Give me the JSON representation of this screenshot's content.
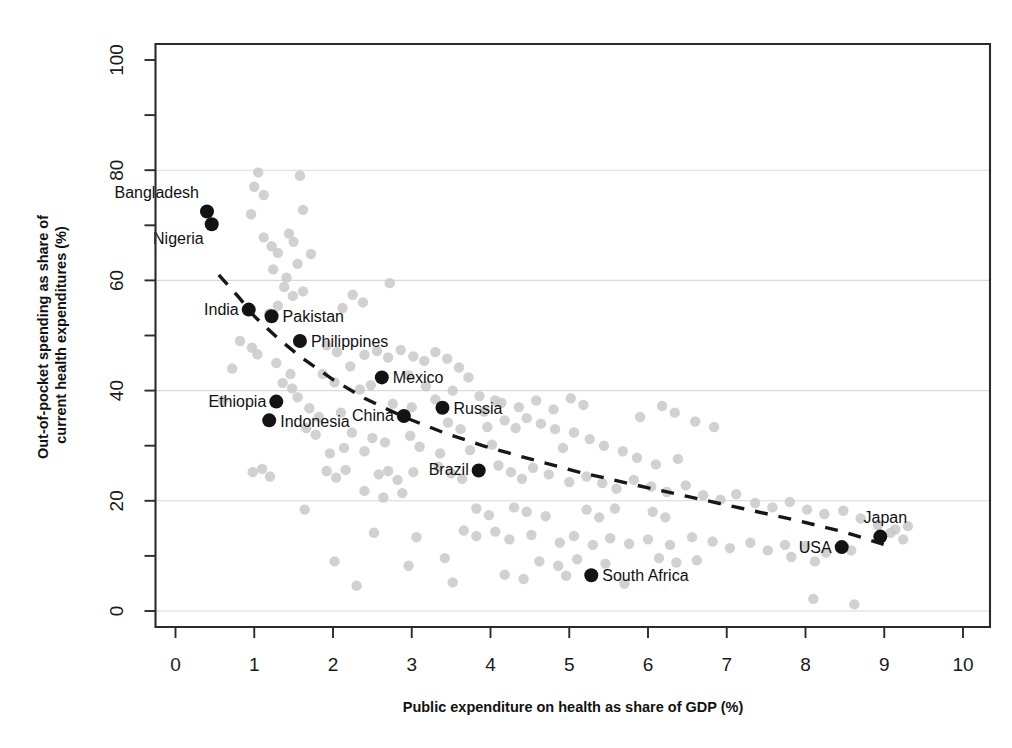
{
  "chart_data": {
    "type": "scatter",
    "title": "",
    "xlabel": "Public expenditure on health as share of GDP (%)",
    "ylabel": "Out-of-pocket spending as share of current health expenditures (%)",
    "xlim": [
      0,
      10
    ],
    "ylim": [
      0,
      100
    ],
    "xticks": [
      0,
      1,
      2,
      3,
      4,
      5,
      6,
      7,
      8,
      9,
      10
    ],
    "xtick_labels": [
      "0",
      "1",
      "2",
      "3",
      "4",
      "5",
      "6",
      "7",
      "8",
      "9",
      "10"
    ],
    "yticks": [
      0,
      20,
      40,
      60,
      80,
      100
    ],
    "ytick_labels": [
      "0",
      "20",
      "40",
      "60",
      "80",
      "100"
    ],
    "yminor_ticks": [
      10,
      30,
      50,
      70,
      90
    ],
    "grid": "horizontal",
    "gridlines_y": [
      0,
      20,
      40,
      60,
      80
    ],
    "legend": "none",
    "point_color": "#c9c9c9",
    "highlight_color": "#131313",
    "trend_color": "#171717",
    "trend_style": "dashed",
    "trend_note": "Downward-sloping dashed fitted curve from about (0.55, 61) to (9.1, 11)",
    "trend_points": [
      [
        0.55,
        61.0
      ],
      [
        0.8,
        57.0
      ],
      [
        1.0,
        53.5
      ],
      [
        1.3,
        49.5
      ],
      [
        1.6,
        46.0
      ],
      [
        2.0,
        42.0
      ],
      [
        2.4,
        38.6
      ],
      [
        2.9,
        35.2
      ],
      [
        3.4,
        32.4
      ],
      [
        3.9,
        30.0
      ],
      [
        4.5,
        27.6
      ],
      [
        5.1,
        25.3
      ],
      [
        5.8,
        23.0
      ],
      [
        6.5,
        20.8
      ],
      [
        7.2,
        18.6
      ],
      [
        7.9,
        16.4
      ],
      [
        8.5,
        14.3
      ],
      [
        9.1,
        11.6
      ]
    ],
    "highlighted": [
      {
        "name": "Bangladesh",
        "x": 0.4,
        "y": 72.5,
        "label_dx": -8,
        "label_dy": -14,
        "anchor": "end"
      },
      {
        "name": "Nigeria",
        "x": 0.46,
        "y": 70.2,
        "label_dx": -8,
        "label_dy": 20,
        "anchor": "end"
      },
      {
        "name": "India",
        "x": 0.93,
        "y": 54.7,
        "label_dx": -10,
        "label_dy": 5,
        "anchor": "end"
      },
      {
        "name": "Pakistan",
        "x": 1.22,
        "y": 53.5,
        "label_dx": 11,
        "label_dy": 6,
        "anchor": "start"
      },
      {
        "name": "Philippines",
        "x": 1.58,
        "y": 49.0,
        "label_dx": 11,
        "label_dy": 6,
        "anchor": "start"
      },
      {
        "name": "Mexico",
        "x": 2.62,
        "y": 42.4,
        "label_dx": 11,
        "label_dy": 6,
        "anchor": "start"
      },
      {
        "name": "Ethiopia",
        "x": 1.28,
        "y": 38.0,
        "label_dx": -10,
        "label_dy": 5,
        "anchor": "end"
      },
      {
        "name": "Indonesia",
        "x": 1.19,
        "y": 34.6,
        "label_dx": 11,
        "label_dy": 7,
        "anchor": "start"
      },
      {
        "name": "China",
        "x": 2.9,
        "y": 35.4,
        "label_dx": -10,
        "label_dy": 5,
        "anchor": "end"
      },
      {
        "name": "Russia",
        "x": 3.39,
        "y": 36.9,
        "label_dx": 11,
        "label_dy": 6,
        "anchor": "start"
      },
      {
        "name": "Brazil",
        "x": 3.85,
        "y": 25.5,
        "label_dx": -10,
        "label_dy": 5,
        "anchor": "end"
      },
      {
        "name": "South Africa",
        "x": 5.28,
        "y": 6.5,
        "label_dx": 11,
        "label_dy": 6,
        "anchor": "start"
      },
      {
        "name": "USA",
        "x": 8.46,
        "y": 11.6,
        "label_dx": -10,
        "label_dy": 6,
        "anchor": "end"
      },
      {
        "name": "Japan",
        "x": 8.95,
        "y": 13.5,
        "label_dx": 5,
        "label_dy": -14,
        "anchor": "middle"
      }
    ],
    "background_points": [
      [
        1.05,
        79.6
      ],
      [
        1.0,
        77.0
      ],
      [
        1.58,
        79.0
      ],
      [
        1.12,
        75.5
      ],
      [
        0.96,
        72.0
      ],
      [
        1.62,
        72.8
      ],
      [
        1.44,
        68.5
      ],
      [
        1.5,
        67.0
      ],
      [
        1.12,
        67.8
      ],
      [
        1.22,
        66.2
      ],
      [
        1.3,
        65.0
      ],
      [
        1.72,
        64.8
      ],
      [
        1.55,
        63.0
      ],
      [
        1.24,
        62.0
      ],
      [
        1.41,
        60.5
      ],
      [
        1.38,
        58.8
      ],
      [
        1.62,
        58.0
      ],
      [
        2.72,
        59.5
      ],
      [
        1.49,
        57.2
      ],
      [
        1.3,
        55.4
      ],
      [
        1.19,
        54.0
      ],
      [
        2.25,
        57.4
      ],
      [
        2.38,
        56.0
      ],
      [
        2.12,
        55.0
      ],
      [
        0.82,
        49.0
      ],
      [
        0.97,
        47.8
      ],
      [
        1.04,
        46.6
      ],
      [
        1.92,
        48.2
      ],
      [
        2.05,
        47.0
      ],
      [
        1.28,
        45.0
      ],
      [
        0.72,
        44.0
      ],
      [
        1.46,
        43.0
      ],
      [
        2.4,
        46.5
      ],
      [
        2.56,
        47.2
      ],
      [
        2.7,
        46.0
      ],
      [
        2.86,
        47.4
      ],
      [
        3.02,
        46.2
      ],
      [
        3.16,
        45.4
      ],
      [
        2.22,
        44.4
      ],
      [
        1.87,
        43.0
      ],
      [
        3.3,
        47.0
      ],
      [
        3.45,
        45.8
      ],
      [
        2.02,
        41.5
      ],
      [
        2.96,
        42.8
      ],
      [
        3.6,
        44.2
      ],
      [
        3.72,
        42.4
      ],
      [
        0.6,
        38.2
      ],
      [
        1.55,
        38.8
      ],
      [
        1.7,
        36.8
      ],
      [
        1.82,
        35.2
      ],
      [
        2.1,
        36.0
      ],
      [
        3.18,
        40.8
      ],
      [
        3.52,
        40.0
      ],
      [
        3.86,
        39.0
      ],
      [
        4.06,
        38.2
      ],
      [
        3.3,
        38.4
      ],
      [
        1.66,
        33.2
      ],
      [
        1.78,
        32.0
      ],
      [
        2.24,
        32.4
      ],
      [
        2.5,
        31.4
      ],
      [
        2.98,
        31.8
      ],
      [
        3.46,
        34.2
      ],
      [
        3.62,
        33.0
      ],
      [
        3.96,
        33.4
      ],
      [
        4.18,
        34.6
      ],
      [
        4.32,
        33.2
      ],
      [
        4.46,
        35.0
      ],
      [
        4.64,
        34.0
      ],
      [
        4.82,
        33.0
      ],
      [
        3.1,
        29.8
      ],
      [
        3.36,
        28.6
      ],
      [
        3.74,
        29.2
      ],
      [
        4.02,
        30.2
      ],
      [
        5.06,
        32.4
      ],
      [
        5.26,
        31.2
      ],
      [
        5.44,
        30.0
      ],
      [
        5.68,
        29.0
      ],
      [
        4.92,
        29.6
      ],
      [
        0.98,
        25.2
      ],
      [
        1.1,
        25.8
      ],
      [
        1.2,
        24.4
      ],
      [
        1.92,
        25.4
      ],
      [
        2.04,
        24.2
      ],
      [
        2.16,
        25.6
      ],
      [
        2.58,
        24.8
      ],
      [
        2.7,
        25.4
      ],
      [
        2.82,
        23.8
      ],
      [
        3.02,
        25.2
      ],
      [
        3.34,
        26.2
      ],
      [
        3.5,
        25.0
      ],
      [
        3.64,
        24.0
      ],
      [
        4.1,
        26.4
      ],
      [
        4.26,
        25.2
      ],
      [
        4.4,
        24.0
      ],
      [
        4.54,
        26.0
      ],
      [
        4.74,
        24.8
      ],
      [
        5.0,
        23.4
      ],
      [
        5.22,
        24.4
      ],
      [
        5.42,
        23.2
      ],
      [
        5.6,
        22.2
      ],
      [
        5.82,
        23.8
      ],
      [
        6.04,
        22.6
      ],
      [
        6.24,
        21.6
      ],
      [
        6.48,
        22.8
      ],
      [
        6.7,
        21.0
      ],
      [
        6.92,
        20.2
      ],
      [
        7.12,
        21.2
      ],
      [
        7.36,
        19.6
      ],
      [
        7.58,
        18.8
      ],
      [
        7.8,
        19.8
      ],
      [
        8.02,
        18.4
      ],
      [
        8.24,
        17.6
      ],
      [
        8.48,
        18.2
      ],
      [
        8.7,
        16.8
      ],
      [
        8.92,
        15.6
      ],
      [
        9.14,
        14.8
      ],
      [
        9.3,
        15.4
      ],
      [
        1.64,
        18.4
      ],
      [
        3.82,
        18.6
      ],
      [
        3.98,
        17.4
      ],
      [
        4.3,
        18.8
      ],
      [
        4.46,
        18.0
      ],
      [
        4.7,
        17.2
      ],
      [
        5.22,
        18.4
      ],
      [
        5.38,
        17.0
      ],
      [
        5.58,
        18.6
      ],
      [
        6.06,
        18.0
      ],
      [
        6.22,
        17.0
      ],
      [
        2.52,
        14.2
      ],
      [
        3.06,
        13.4
      ],
      [
        3.66,
        14.6
      ],
      [
        3.82,
        13.6
      ],
      [
        4.06,
        14.4
      ],
      [
        4.24,
        13.0
      ],
      [
        4.52,
        13.8
      ],
      [
        4.88,
        12.4
      ],
      [
        5.06,
        13.6
      ],
      [
        5.3,
        12.0
      ],
      [
        5.52,
        13.2
      ],
      [
        5.76,
        12.2
      ],
      [
        6.0,
        13.0
      ],
      [
        6.28,
        12.0
      ],
      [
        6.56,
        13.4
      ],
      [
        6.82,
        12.6
      ],
      [
        7.04,
        11.4
      ],
      [
        7.3,
        12.4
      ],
      [
        7.52,
        11.0
      ],
      [
        7.74,
        12.0
      ],
      [
        8.0,
        11.8
      ],
      [
        8.26,
        10.6
      ],
      [
        8.58,
        11.0
      ],
      [
        9.08,
        14.2
      ],
      [
        9.24,
        13.0
      ],
      [
        2.02,
        9.0
      ],
      [
        2.96,
        8.2
      ],
      [
        3.42,
        9.6
      ],
      [
        4.62,
        9.0
      ],
      [
        4.86,
        8.2
      ],
      [
        5.1,
        9.4
      ],
      [
        5.46,
        8.6
      ],
      [
        6.14,
        9.6
      ],
      [
        6.36,
        8.8
      ],
      [
        6.62,
        9.2
      ],
      [
        7.82,
        9.8
      ],
      [
        8.12,
        9.0
      ],
      [
        4.18,
        6.6
      ],
      [
        4.42,
        5.8
      ],
      [
        4.96,
        6.4
      ],
      [
        2.3,
        4.6
      ],
      [
        3.52,
        5.2
      ],
      [
        5.7,
        5.0
      ],
      [
        8.1,
        2.2
      ],
      [
        8.62,
        1.2
      ],
      [
        2.76,
        37.6
      ],
      [
        3.0,
        37.0
      ],
      [
        1.36,
        41.4
      ],
      [
        1.48,
        40.4
      ],
      [
        2.48,
        41.0
      ],
      [
        2.34,
        40.2
      ],
      [
        3.92,
        36.2
      ],
      [
        4.14,
        37.8
      ],
      [
        4.36,
        37.0
      ],
      [
        4.58,
        38.2
      ],
      [
        4.8,
        36.6
      ],
      [
        5.02,
        38.6
      ],
      [
        5.18,
        37.4
      ],
      [
        6.18,
        37.2
      ],
      [
        6.34,
        36.0
      ],
      [
        5.9,
        35.2
      ],
      [
        6.6,
        34.4
      ],
      [
        6.84,
        33.4
      ],
      [
        2.66,
        30.6
      ],
      [
        2.4,
        29.0
      ],
      [
        2.14,
        29.6
      ],
      [
        1.96,
        28.6
      ],
      [
        5.86,
        27.8
      ],
      [
        6.1,
        26.6
      ],
      [
        6.38,
        27.6
      ],
      [
        2.88,
        21.4
      ],
      [
        2.64,
        20.6
      ],
      [
        2.4,
        21.8
      ]
    ]
  }
}
